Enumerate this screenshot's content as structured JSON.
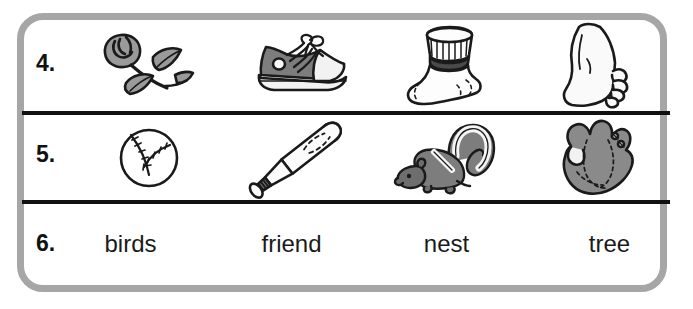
{
  "worksheet": {
    "title": "Phonics picture and word worksheet rows 4-6",
    "frame_color": "#a6a6a6",
    "rule_color": "#111111",
    "background_color": "#ffffff"
  },
  "rows": [
    {
      "number": "4.",
      "type": "pictures",
      "items": [
        {
          "label": "rose",
          "icon": "rose-icon"
        },
        {
          "label": "shoe",
          "icon": "shoe-icon"
        },
        {
          "label": "sock",
          "icon": "sock-icon"
        },
        {
          "label": "foot",
          "icon": "foot-icon"
        }
      ]
    },
    {
      "number": "5.",
      "type": "pictures",
      "items": [
        {
          "label": "baseball",
          "icon": "baseball-icon"
        },
        {
          "label": "bat",
          "icon": "baseball-bat-icon"
        },
        {
          "label": "skunk",
          "icon": "skunk-icon"
        },
        {
          "label": "glove",
          "icon": "baseball-glove-icon"
        }
      ]
    },
    {
      "number": "6.",
      "type": "words",
      "items": [
        {
          "label": "birds"
        },
        {
          "label": "friend"
        },
        {
          "label": "nest"
        },
        {
          "label": "tree"
        }
      ]
    }
  ]
}
